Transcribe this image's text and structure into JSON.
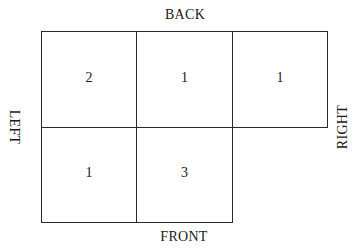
{
  "diagram": {
    "labels": {
      "back": "BACK",
      "front": "FRONT",
      "left": "LEFT",
      "right": "RIGHT"
    },
    "grid": {
      "rows": [
        {
          "cells": [
            {
              "value": "2"
            },
            {
              "value": "1"
            },
            {
              "value": "1"
            }
          ]
        },
        {
          "cells": [
            {
              "value": "1"
            },
            {
              "value": "3"
            }
          ]
        }
      ]
    },
    "colors": {
      "line": "#2a2a2a",
      "text": "#1a1a1a",
      "background": "#ffffff"
    }
  }
}
